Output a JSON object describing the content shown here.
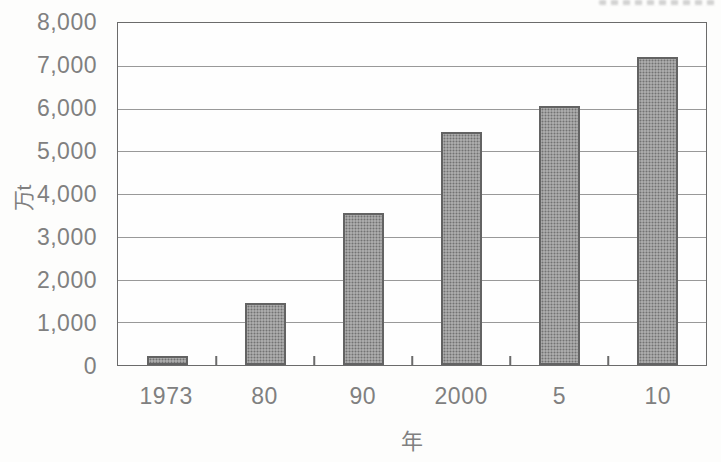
{
  "chart_data": {
    "type": "bar",
    "xlabel": "年",
    "ylabel": "万t",
    "categories": [
      "1973",
      "80",
      "90",
      "2000",
      "5",
      "10"
    ],
    "values": [
      200,
      1450,
      3550,
      5450,
      6050,
      7200
    ],
    "ylim": [
      0,
      8000
    ],
    "ytick_step": 1000,
    "ytick_labels": [
      "0",
      "1,000",
      "2,000",
      "3,000",
      "4,000",
      "5,000",
      "6,000",
      "7,000",
      "8,000"
    ],
    "grid": true,
    "legend": "none",
    "colors": {
      "bar_fill": "#9e9e9e",
      "bar_border": "#636363",
      "grid": "#999999",
      "axis": "#6b6b6b",
      "text": "#808080",
      "background": "#fdfdfc"
    }
  }
}
